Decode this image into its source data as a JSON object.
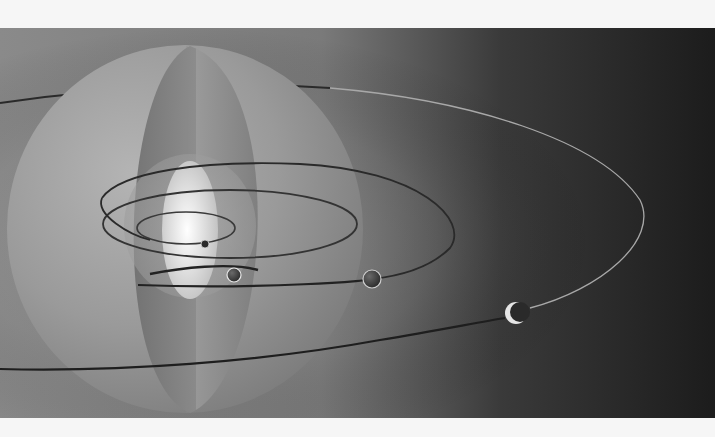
{
  "illustration": {
    "subject": "Concentric celestial spheres with elliptical planetary orbits",
    "colors": {
      "margin": "#f6f6f6",
      "background_light": "#8e8e8e",
      "background_dark": "#1e1e1e",
      "sphere_outer": "#9a9a9a",
      "sphere_slice": "#7c7c7c",
      "core_glow": "#ffffff",
      "orbit_line": "#2a2a2a",
      "planet": "#3a3a3a"
    },
    "elements": {
      "outer_sphere": "outer-sphere",
      "middle_slice": "middle-slice",
      "inner_core": "glowing-core",
      "orbits": [
        "orbit-1",
        "orbit-2",
        "orbit-3",
        "orbit-4"
      ],
      "planets": [
        "planet-1",
        "planet-2",
        "planet-3",
        "crescent-moon"
      ]
    }
  }
}
